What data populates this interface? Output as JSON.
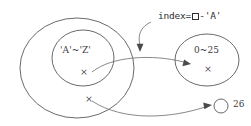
{
  "figure": {
    "background_color": "#ffffff",
    "stroke_color": "#59595c",
    "text_color": "#3c3c3f"
  },
  "annotation": {
    "prefix": "index=",
    "box_glyph": "empty-square",
    "suffix": "-'A'",
    "full_text": "index=□-'A'"
  },
  "sets": {
    "outer_left": {
      "label": "",
      "member_mark": "×"
    },
    "inner_left": {
      "label": "'A'~'Z'",
      "member_mark": "×"
    },
    "right": {
      "label": "0~25",
      "member_mark": "×"
    },
    "lone_right": {
      "label": "26"
    }
  },
  "arrows": [
    {
      "name": "annotation-pointer",
      "from": "index-label",
      "to": "mapping-arrow"
    },
    {
      "name": "letter-to-index-arrow",
      "from": "inner-left-member",
      "to": "right-set-member"
    },
    {
      "name": "other-to-26-arrow",
      "from": "outer-left-member",
      "to": "lone-circle-26"
    }
  ]
}
